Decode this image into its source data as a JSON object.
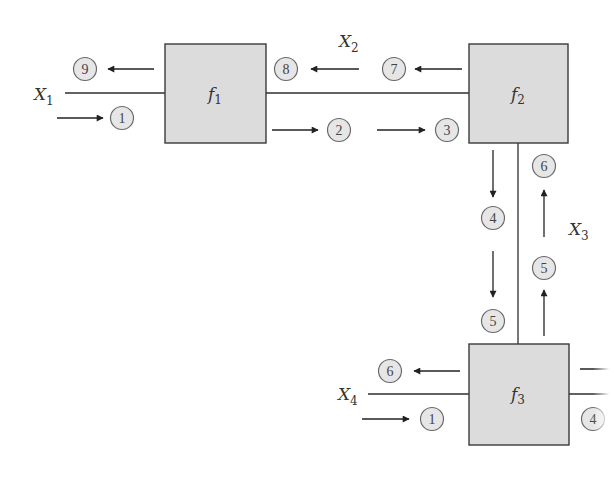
{
  "diagram": {
    "blocks": [
      {
        "id": "f1",
        "func": "f",
        "sub": "1"
      },
      {
        "id": "f2",
        "func": "f",
        "sub": "2"
      },
      {
        "id": "f3",
        "func": "f",
        "sub": "3"
      }
    ],
    "variables": [
      {
        "id": "X1",
        "var": "X",
        "sub": "1"
      },
      {
        "id": "X2",
        "var": "X",
        "sub": "2"
      },
      {
        "id": "X3",
        "var": "X",
        "sub": "3"
      },
      {
        "id": "X4",
        "var": "X",
        "sub": "4"
      }
    ],
    "markers": {
      "x1_out": "9",
      "x1_in": "1",
      "x2_left_out": "8",
      "x2_right_out": "7",
      "x2_left_in": "2",
      "x2_right_in": "3",
      "x3_down_top": "4",
      "x3_down_bottom": "5",
      "x3_up_top": "6",
      "x3_up_bottom": "5",
      "x4_out": "6",
      "x4_in": "1",
      "f3_right": "4"
    },
    "colors": {
      "block_fill": "#dcdcdc",
      "block_stroke": "#3a3a3a",
      "line": "#2e2e2e",
      "marker_fill": "#e6e6e6",
      "marker_stroke": "#6a6a6a"
    }
  }
}
